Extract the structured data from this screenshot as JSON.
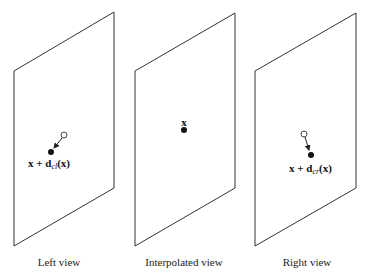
{
  "panels": [
    {
      "id": "left",
      "caption": "Left view",
      "point_label_main": "x + d",
      "point_label_sub": "cl",
      "point_label_tail": "(x)"
    },
    {
      "id": "interpolated",
      "caption": "Interpolated view",
      "point_label_main": "x"
    },
    {
      "id": "right",
      "caption": "Right view",
      "point_label_main": "x + d",
      "point_label_sub": "cr",
      "point_label_tail": "(x)"
    }
  ],
  "colors": {
    "stroke": "#333333",
    "dot": "#111111",
    "background": "#ffffff"
  }
}
